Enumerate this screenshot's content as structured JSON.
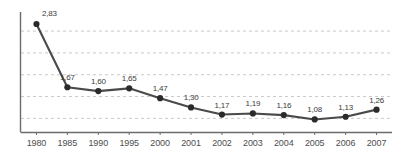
{
  "chart_data": {
    "type": "line",
    "title": "",
    "subtitle": "",
    "xlabel": "",
    "ylabel": "",
    "categories": [
      "1980",
      "1985",
      "1990",
      "1995",
      "2000",
      "2001",
      "2002",
      "2003",
      "2004",
      "2005",
      "2006",
      "2007"
    ],
    "values": [
      2.83,
      1.67,
      1.6,
      1.65,
      1.47,
      1.3,
      1.17,
      1.19,
      1.16,
      1.08,
      1.13,
      1.26
    ],
    "point_labels": [
      "2,83",
      "1,67",
      "1,60",
      "1,65",
      "1,47",
      "1,30",
      "1,17",
      "1,19",
      "1,16",
      "1,08",
      "1,13",
      "1,26"
    ],
    "decimal_separator": ",",
    "ylim": [
      0.85,
      3.05
    ],
    "gridlines": [
      1.1,
      1.5,
      1.9,
      2.3,
      2.7
    ],
    "grid": true,
    "grid_style": "dashed",
    "legend": "none",
    "legend_entries": [],
    "series": [
      {
        "name": "series-1",
        "values": [
          2.83,
          1.67,
          1.6,
          1.65,
          1.47,
          1.3,
          1.17,
          1.19,
          1.16,
          1.08,
          1.13,
          1.26
        ]
      }
    ],
    "colors": {
      "line": "#4a4a4a",
      "marker": "#2b2b2b",
      "grid": "#c9c9c9",
      "axis": "#6b6b6b",
      "label_text": "#3b3b3b",
      "tick_text": "#4d4d4d",
      "background": "#ffffff"
    }
  }
}
